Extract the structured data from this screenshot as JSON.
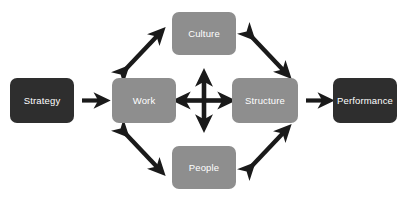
{
  "diagram": {
    "background_color": "#ffffff",
    "colors": {
      "dark_node": "#2e2e2e",
      "gray_node": "#8e8e8e",
      "arrow": "#1a1a1a",
      "label_text": "#ffffff"
    },
    "nodes": [
      {
        "id": "strategy",
        "label": "Strategy",
        "style": "dark",
        "x": 10,
        "y": 78,
        "width": 64,
        "height": 45
      },
      {
        "id": "work",
        "label": "Work",
        "style": "gray",
        "x": 112,
        "y": 78,
        "width": 64,
        "height": 45
      },
      {
        "id": "culture",
        "label": "Culture",
        "style": "gray",
        "x": 172,
        "y": 12,
        "width": 64,
        "height": 43
      },
      {
        "id": "people",
        "label": "People",
        "style": "gray",
        "x": 172,
        "y": 146,
        "width": 64,
        "height": 43
      },
      {
        "id": "structure",
        "label": "Structure",
        "style": "gray",
        "x": 232,
        "y": 78,
        "width": 66,
        "height": 45
      },
      {
        "id": "performance",
        "label": "Performance",
        "style": "dark",
        "x": 333,
        "y": 78,
        "width": 64,
        "height": 45
      }
    ],
    "connectors": [
      {
        "id": "strategy-to-work",
        "kind": "single-arrow-right",
        "from": "strategy",
        "to": "work"
      },
      {
        "id": "work-to-culture",
        "kind": "double-arrow-diagonal-up-right",
        "from": "work",
        "to": "culture"
      },
      {
        "id": "work-to-people",
        "kind": "double-arrow-diagonal-down-right",
        "from": "work",
        "to": "people"
      },
      {
        "id": "culture-to-structure",
        "kind": "double-arrow-diagonal-down-right",
        "from": "culture",
        "to": "structure"
      },
      {
        "id": "people-to-structure",
        "kind": "double-arrow-diagonal-up-right",
        "from": "people",
        "to": "structure"
      },
      {
        "id": "center-four-way",
        "kind": "four-way-arrow",
        "from": "work",
        "to": "structure"
      },
      {
        "id": "structure-to-performance",
        "kind": "single-arrow-right",
        "from": "structure",
        "to": "performance"
      }
    ]
  }
}
